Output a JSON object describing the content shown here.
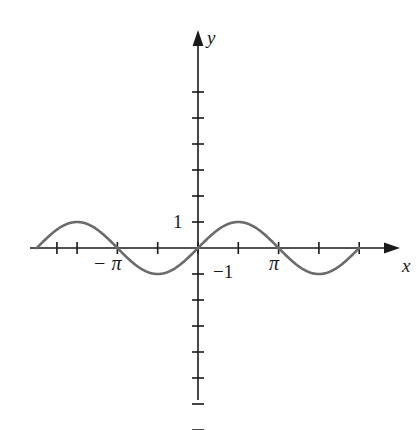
{
  "figure": {
    "background_color": "#ffffff",
    "axis_color": "#1a1a1a",
    "curve_color": "#6b6b6b"
  },
  "labels": {
    "y_axis": "y",
    "x_axis": "x",
    "y_tick_positive_one": "1",
    "y_tick_negative_one": "−1",
    "x_tick_negative_pi": "− π",
    "x_tick_pi": "π"
  },
  "chart_data": {
    "type": "line",
    "title": "",
    "subtitle": "",
    "xlabel": "x",
    "ylabel": "y",
    "function": "y = sin(x)",
    "grid": false,
    "legend_position": "none",
    "xlim": [
      -2.9845,
      5.0124
    ],
    "ylim": [
      -8.3846,
      8.3846
    ],
    "x_axis": {
      "label": "x",
      "pixel_origin": 198,
      "pixel_per_unit": 25.66,
      "tick_interval": 1.5708,
      "tick_values": [
        -5.4978,
        -4.7124,
        -3.1416,
        -1.5708,
        0,
        1.5708,
        3.1416,
        4.7124,
        6.2832
      ],
      "labeled_ticks": [
        {
          "value": -3.1416,
          "label": "− π"
        },
        {
          "value": 3.1416,
          "label": "π"
        }
      ],
      "arrow_end": "right"
    },
    "y_axis": {
      "label": "y",
      "pixel_origin": 248,
      "pixel_per_unit": 26.0,
      "tick_interval": 1,
      "tick_values": [
        -7,
        -6,
        -5,
        -4,
        -3,
        -2,
        -1,
        1,
        2,
        3,
        4,
        5,
        6
      ],
      "labeled_ticks": [
        {
          "value": 1,
          "label": "1"
        },
        {
          "value": -1,
          "label": "−1"
        }
      ],
      "arrow_end": "up"
    },
    "series": [
      {
        "name": "y = sin(x)",
        "color": "#6b6b6b",
        "line_width": 2.6,
        "x_start": -6.2832,
        "x_end": 6.2832,
        "amplitude": 1,
        "period": 6.2832,
        "x": [
          -6.2832,
          -5.4978,
          -4.7124,
          -3.927,
          -3.1416,
          -2.3562,
          -1.5708,
          -0.7854,
          0,
          0.7854,
          1.5708,
          2.3562,
          3.1416,
          3.927,
          4.7124,
          5.4978,
          6.2832
        ],
        "y": [
          0,
          0.7071,
          1,
          0.7071,
          0,
          -0.7071,
          -1,
          -0.7071,
          0,
          0.7071,
          1,
          0.7071,
          0,
          -0.7071,
          -1,
          -0.7071,
          0
        ],
        "key_points": [
          {
            "x": -6.2832,
            "y": 0,
            "kind": "zero-crossing"
          },
          {
            "x": -4.7124,
            "y": 1,
            "kind": "maximum"
          },
          {
            "x": -3.1416,
            "y": 0,
            "kind": "zero-crossing"
          },
          {
            "x": -1.5708,
            "y": -1,
            "kind": "minimum"
          },
          {
            "x": 0,
            "y": 0,
            "kind": "zero-crossing"
          },
          {
            "x": 1.5708,
            "y": 1,
            "kind": "maximum"
          },
          {
            "x": 3.1416,
            "y": 0,
            "kind": "zero-crossing"
          },
          {
            "x": 4.7124,
            "y": -1,
            "kind": "minimum"
          },
          {
            "x": 6.2832,
            "y": 0,
            "kind": "zero-crossing"
          }
        ]
      }
    ]
  }
}
